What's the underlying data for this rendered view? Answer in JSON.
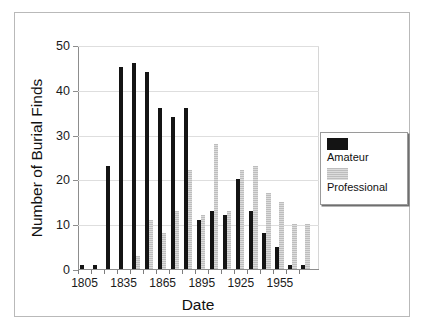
{
  "chart_data": {
    "type": "bar",
    "title": "",
    "xlabel": "Date",
    "ylabel": "Number of Burial Finds",
    "ylim": [
      0,
      50
    ],
    "yticks": [
      0,
      10,
      20,
      30,
      40,
      50
    ],
    "xlim": [
      1800,
      1985
    ],
    "xticks": [
      1805,
      1835,
      1865,
      1895,
      1925,
      1955
    ],
    "xtick_labels": [
      "1805",
      "1835",
      "1865",
      "1895",
      "1925",
      "1955"
    ],
    "grid": "horizontal",
    "legend_position": "right",
    "bin_width_years": 10,
    "categories": [
      "1805",
      "1815",
      "1825",
      "1835",
      "1845",
      "1855",
      "1865",
      "1875",
      "1885",
      "1895",
      "1905",
      "1915",
      "1925",
      "1935",
      "1945",
      "1955",
      "1965",
      "1975"
    ],
    "series": [
      {
        "name": "Amateur",
        "color": "#141414",
        "values": [
          1,
          1,
          23,
          45,
          46,
          44,
          36,
          34,
          36,
          11,
          13,
          12,
          20,
          13,
          8,
          5,
          1,
          1
        ]
      },
      {
        "name": "Professional",
        "color": "#c9c9c9",
        "values": [
          0,
          0,
          0,
          0,
          3,
          11,
          8,
          13,
          22,
          12,
          28,
          13,
          22,
          23,
          17,
          15,
          10,
          10
        ]
      }
    ]
  },
  "legend": {
    "entries": [
      {
        "label": "Amateur",
        "swatch": "black-square-swatch"
      },
      {
        "label": "Professional",
        "swatch": "gray-square-swatch"
      }
    ]
  }
}
